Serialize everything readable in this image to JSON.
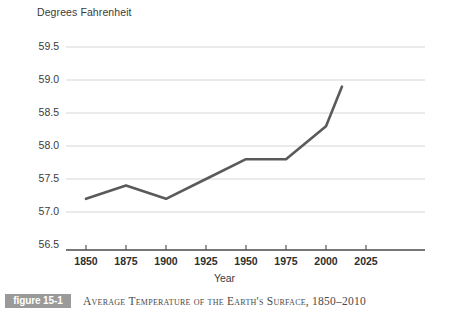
{
  "figure": {
    "badge_label": "figure 15-1",
    "caption": "Average Temperature of the Earth's Surface, 1850–2010"
  },
  "colors": {
    "line": "#5a5a5a",
    "gridline": "#d6d6d6",
    "axis": "#4a4a4a",
    "tick_label": "#2e2e2e",
    "badge_background": "#9a9a9a",
    "badge_text": "#ffffff",
    "caption_text": "#4a4a4a",
    "background": "#ffffff"
  },
  "chart_data": {
    "type": "line",
    "title": "Average Temperature of the Earth's Surface, 1850–2010",
    "xlabel": "Year",
    "ylabel": "Degrees Fahrenheit",
    "x": [
      1850,
      1875,
      1900,
      1925,
      1950,
      1975,
      2000,
      2010
    ],
    "values": [
      57.2,
      57.4,
      57.2,
      57.5,
      57.8,
      57.8,
      58.3,
      58.9
    ],
    "series": [
      {
        "name": "Average global surface temperature",
        "values": [
          57.2,
          57.4,
          57.2,
          57.5,
          57.8,
          57.8,
          58.3,
          58.9
        ]
      }
    ],
    "xlim": [
      1850,
      2032
    ],
    "ylim": [
      56.5,
      59.5
    ],
    "xticks": [
      1850,
      1875,
      1900,
      1925,
      1950,
      1975,
      2000,
      2025
    ],
    "xtick_labels": [
      "1850",
      "1875",
      "1900",
      "1925",
      "1950",
      "1975",
      "2000",
      "2025"
    ],
    "yticks": [
      56.5,
      57.0,
      57.5,
      58.0,
      58.5,
      59.0,
      59.5
    ],
    "ytick_labels": [
      "56.5",
      "57.0",
      "57.5",
      "58.0",
      "58.5",
      "59.0",
      "59.5"
    ],
    "grid": "horizontal",
    "legend": "none"
  }
}
